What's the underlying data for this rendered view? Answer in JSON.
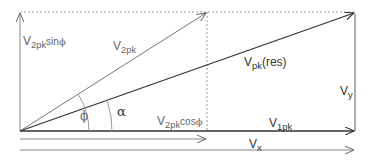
{
  "diagram": {
    "labels": {
      "v2pk_sin": {
        "base": "V",
        "sub": "2pk",
        "suffix": "sin",
        "greek": "ϕ"
      },
      "v2pk": {
        "base": "V",
        "sub": "2pk"
      },
      "vpk_res": {
        "base": "V",
        "sub": "pk",
        "suffix": "(res)"
      },
      "phi": "ϕ",
      "alpha": "α",
      "v2pk_cos": {
        "base": "V",
        "sub": "2pk",
        "suffix": "cos",
        "greek": "ϕ"
      },
      "v1pk": {
        "base": "V",
        "sub": "1pk"
      },
      "vy": {
        "base": "V",
        "sub": "y"
      },
      "vx": {
        "base": "V",
        "sub": "x"
      }
    },
    "colors": {
      "line": "#666666",
      "dark_line": "#333333",
      "dotted": "#999999",
      "text": "#666666"
    }
  }
}
